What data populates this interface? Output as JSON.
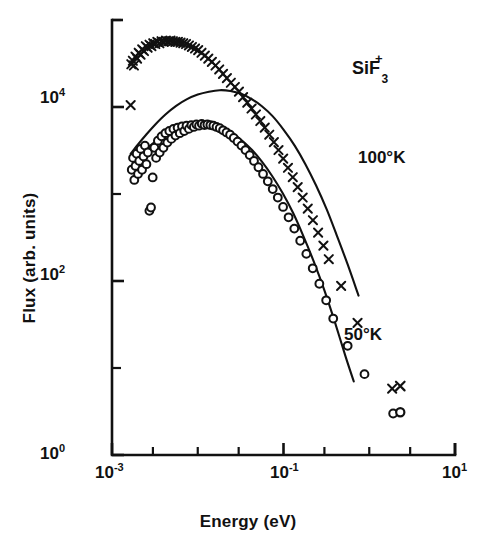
{
  "figure": {
    "background_color": "#ffffff",
    "ink_color": "#111111"
  },
  "axes": {
    "x_title": "Energy (eV)",
    "y_title": "Flux (arb. units)",
    "x_tick_labels": [
      {
        "mantissa": "10",
        "exponent": "-3",
        "value": 0.001
      },
      {
        "mantissa": "10",
        "exponent": "-1",
        "value": 0.1
      },
      {
        "mantissa": "10",
        "exponent": "1",
        "value": 10
      }
    ],
    "y_tick_labels": [
      {
        "mantissa": "10",
        "exponent": "4",
        "value": 10000
      },
      {
        "mantissa": "10",
        "exponent": "2",
        "value": 100
      },
      {
        "mantissa": "10",
        "exponent": "0",
        "value": 1
      }
    ]
  },
  "annotations": {
    "species": {
      "formula": "SiF",
      "subscript": "3",
      "superscript": "+"
    },
    "series_hot": "100°K",
    "series_cold": "50°K"
  },
  "chart_data": {
    "type": "scatter",
    "title": "",
    "xlabel": "Energy (eV)",
    "ylabel": "Flux (arb. units)",
    "xscale": "log",
    "yscale": "log",
    "xlim": [
      0.001,
      10
    ],
    "ylim": [
      1,
      100000
    ],
    "grid": false,
    "legend_position": "inline-annotation",
    "series": [
      {
        "name": "100°K",
        "marker": "x",
        "label": "100°K",
        "points": [
          [
            0.00165,
            10500
          ],
          [
            0.00168,
            31000
          ],
          [
            0.00175,
            34000
          ],
          [
            0.0018,
            30000
          ],
          [
            0.00188,
            38000
          ],
          [
            0.00196,
            36000
          ],
          [
            0.00205,
            42000
          ],
          [
            0.00215,
            40000
          ],
          [
            0.00225,
            46000
          ],
          [
            0.00236,
            44000
          ],
          [
            0.00248,
            50000
          ],
          [
            0.0026,
            48000
          ],
          [
            0.00274,
            52000
          ],
          [
            0.00288,
            50000
          ],
          [
            0.00303,
            54000
          ],
          [
            0.0032,
            53000
          ],
          [
            0.00338,
            56000
          ],
          [
            0.00357,
            54000
          ],
          [
            0.00378,
            57000
          ],
          [
            0.004,
            56000
          ],
          [
            0.00425,
            58000
          ],
          [
            0.00452,
            57000
          ],
          [
            0.00481,
            58000
          ],
          [
            0.00513,
            57000
          ],
          [
            0.00548,
            56000
          ],
          [
            0.00587,
            56000
          ],
          [
            0.0063,
            55000
          ],
          [
            0.00677,
            54000
          ],
          [
            0.0073,
            53000
          ],
          [
            0.00789,
            51000
          ],
          [
            0.00855,
            49000
          ],
          [
            0.00929,
            47000
          ],
          [
            0.01012,
            45000
          ],
          [
            0.01105,
            42000
          ],
          [
            0.0121,
            39000
          ],
          [
            0.01328,
            36000
          ],
          [
            0.01461,
            33000
          ],
          [
            0.01611,
            30000
          ],
          [
            0.0178,
            27000
          ],
          [
            0.01971,
            24000
          ],
          [
            0.02187,
            21500
          ],
          [
            0.02432,
            19000
          ],
          [
            0.02709,
            17000
          ],
          [
            0.03022,
            15000
          ],
          [
            0.03378,
            13000
          ],
          [
            0.03782,
            11200
          ],
          [
            0.04242,
            9600
          ],
          [
            0.04766,
            8200
          ],
          [
            0.05363,
            6900
          ],
          [
            0.06045,
            5800
          ],
          [
            0.06825,
            4800
          ],
          [
            0.07718,
            3950
          ],
          [
            0.08741,
            3200
          ],
          [
            0.09916,
            2550
          ],
          [
            0.1127,
            2000
          ],
          [
            0.1283,
            1560
          ],
          [
            0.1464,
            1200
          ],
          [
            0.1674,
            910
          ],
          [
            0.1918,
            680
          ],
          [
            0.2202,
            500
          ],
          [
            0.2533,
            360
          ],
          [
            0.292,
            255
          ],
          [
            0.3372,
            178
          ],
          [
            0.47,
            88
          ],
          [
            0.73,
            33
          ],
          [
            1.85,
            5.8
          ]
        ]
      },
      {
        "name": "50°K",
        "marker": "o",
        "label": "50°K",
        "points": [
          [
            0.0017,
            1900
          ],
          [
            0.00176,
            2600
          ],
          [
            0.00182,
            1450
          ],
          [
            0.00188,
            2100
          ],
          [
            0.00194,
            2900
          ],
          [
            0.00201,
            1700
          ],
          [
            0.00208,
            2400
          ],
          [
            0.00216,
            3300
          ],
          [
            0.00224,
            1900
          ],
          [
            0.00233,
            2700
          ],
          [
            0.00242,
            3600
          ],
          [
            0.00252,
            2200
          ],
          [
            0.00262,
            3000
          ],
          [
            0.00273,
            640
          ],
          [
            0.00285,
            700
          ],
          [
            0.00298,
            1550
          ],
          [
            0.00312,
            3400
          ],
          [
            0.00327,
            2600
          ],
          [
            0.00343,
            4100
          ],
          [
            0.0036,
            3000
          ],
          [
            0.00378,
            4600
          ],
          [
            0.00398,
            3400
          ],
          [
            0.00419,
            5000
          ],
          [
            0.00442,
            3900
          ],
          [
            0.00466,
            5300
          ],
          [
            0.00492,
            4300
          ],
          [
            0.0052,
            5600
          ],
          [
            0.0055,
            4700
          ],
          [
            0.00582,
            5800
          ],
          [
            0.00617,
            5000
          ],
          [
            0.00655,
            6000
          ],
          [
            0.00696,
            5300
          ],
          [
            0.0074,
            6100
          ],
          [
            0.00789,
            5600
          ],
          [
            0.00842,
            6200
          ],
          [
            0.009,
            5900
          ],
          [
            0.00964,
            6300
          ],
          [
            0.01035,
            6100
          ],
          [
            0.01113,
            6400
          ],
          [
            0.01199,
            6200
          ],
          [
            0.01295,
            6300
          ],
          [
            0.01402,
            6200
          ],
          [
            0.01521,
            6100
          ],
          [
            0.01655,
            5900
          ],
          [
            0.01805,
            5700
          ],
          [
            0.01974,
            5400
          ],
          [
            0.02165,
            5100
          ],
          [
            0.02382,
            4800
          ],
          [
            0.02629,
            4400
          ],
          [
            0.02911,
            4000
          ],
          [
            0.03234,
            3600
          ],
          [
            0.03605,
            3200
          ],
          [
            0.04033,
            2800
          ],
          [
            0.04528,
            2400
          ],
          [
            0.05103,
            2030
          ],
          [
            0.05773,
            1700
          ],
          [
            0.06559,
            1400
          ],
          [
            0.07485,
            1140
          ],
          [
            0.08582,
            910
          ],
          [
            0.0989,
            710
          ],
          [
            0.1146,
            540
          ],
          [
            0.1336,
            400
          ],
          [
            0.1566,
            290
          ],
          [
            0.1847,
            205
          ],
          [
            0.2192,
            140
          ],
          [
            0.2618,
            93
          ],
          [
            0.3144,
            60
          ],
          [
            0.38,
            37
          ],
          [
            0.56,
            18
          ],
          [
            0.88,
            8.5
          ],
          [
            1.9,
            3.0
          ]
        ]
      }
    ],
    "fit_curves": [
      {
        "name": "100°K fit",
        "points": [
          [
            0.00165,
            2900
          ],
          [
            0.002,
            3700
          ],
          [
            0.0025,
            4800
          ],
          [
            0.0032,
            6300
          ],
          [
            0.0042,
            8200
          ],
          [
            0.0056,
            10300
          ],
          [
            0.0075,
            12300
          ],
          [
            0.01,
            13900
          ],
          [
            0.0135,
            15000
          ],
          [
            0.018,
            15600
          ],
          [
            0.024,
            15300
          ],
          [
            0.032,
            14200
          ],
          [
            0.042,
            12400
          ],
          [
            0.056,
            10200
          ],
          [
            0.075,
            7800
          ],
          [
            0.1,
            5500
          ],
          [
            0.135,
            3600
          ],
          [
            0.18,
            2200
          ],
          [
            0.24,
            1250
          ],
          [
            0.32,
            660
          ],
          [
            0.42,
            330
          ],
          [
            0.56,
            155
          ],
          [
            0.75,
            68
          ]
        ]
      },
      {
        "name": "50°K fit",
        "points": [
          [
            0.00175,
            2300
          ],
          [
            0.0022,
            2900
          ],
          [
            0.0028,
            3600
          ],
          [
            0.0036,
            4400
          ],
          [
            0.0047,
            5200
          ],
          [
            0.0062,
            5900
          ],
          [
            0.0082,
            6300
          ],
          [
            0.011,
            6400
          ],
          [
            0.0145,
            6200
          ],
          [
            0.019,
            5700
          ],
          [
            0.025,
            5000
          ],
          [
            0.033,
            4100
          ],
          [
            0.043,
            3200
          ],
          [
            0.056,
            2350
          ],
          [
            0.074,
            1600
          ],
          [
            0.098,
            1020
          ],
          [
            0.13,
            600
          ],
          [
            0.17,
            330
          ],
          [
            0.225,
            168
          ],
          [
            0.3,
            78
          ],
          [
            0.4,
            33
          ],
          [
            0.53,
            13.5
          ],
          [
            0.66,
            7.0
          ]
        ]
      }
    ],
    "outlier_points": [
      {
        "series": "100°K",
        "marker": "x",
        "x": 2.3,
        "y": 6.2
      },
      {
        "series": "50°K",
        "marker": "o",
        "x": 2.3,
        "y": 3.1
      }
    ]
  }
}
